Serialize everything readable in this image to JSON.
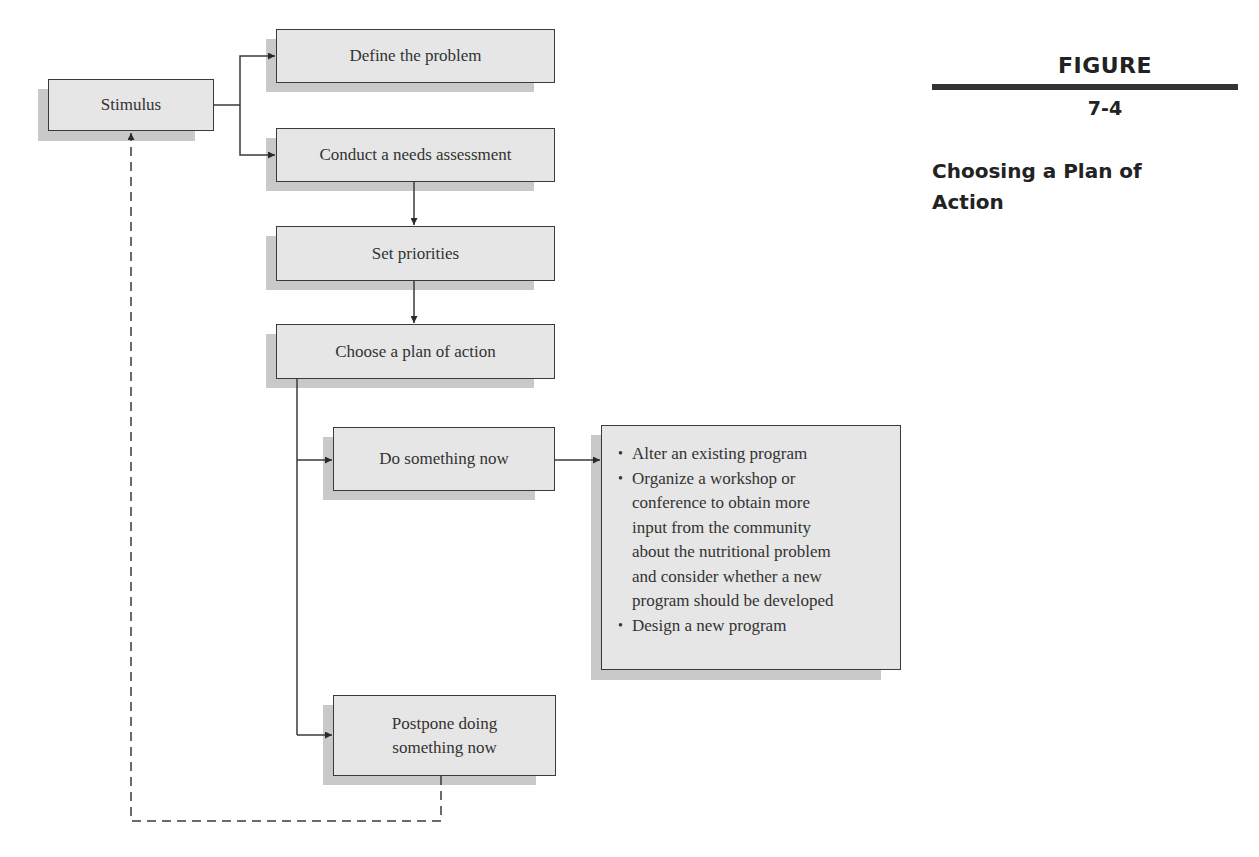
{
  "figure": {
    "label": "FIGURE",
    "number": "7-4",
    "title_line1": "Choosing a Plan of",
    "title_line2": "Action"
  },
  "nodes": {
    "stimulus": "Stimulus",
    "define_problem": "Define the problem",
    "needs_assessment": "Conduct a needs assessment",
    "set_priorities": "Set priorities",
    "choose_plan": "Choose a plan of action",
    "do_something": "Do something now",
    "postpone_line1": "Postpone doing",
    "postpone_line2": "something now"
  },
  "options": {
    "items": [
      "Alter an existing program",
      "Organize a workshop or conference to obtain more input from the community about the nutritional problem and consider whether a new program should be developed",
      "Design a new program"
    ],
    "item2_lines": [
      "Organize a workshop or",
      "conference to obtain more",
      "input from the community",
      "about the nutritional problem",
      "and consider whether a new",
      "program should be developed"
    ]
  },
  "edges": [
    {
      "from": "stimulus",
      "to": "define_problem",
      "style": "solid"
    },
    {
      "from": "stimulus",
      "to": "needs_assessment",
      "style": "solid"
    },
    {
      "from": "needs_assessment",
      "to": "set_priorities",
      "style": "solid"
    },
    {
      "from": "set_priorities",
      "to": "choose_plan",
      "style": "solid"
    },
    {
      "from": "choose_plan",
      "to": "do_something",
      "style": "solid"
    },
    {
      "from": "choose_plan",
      "to": "postpone",
      "style": "solid"
    },
    {
      "from": "do_something",
      "to": "options",
      "style": "solid"
    },
    {
      "from": "postpone",
      "to": "stimulus",
      "style": "dashed"
    }
  ],
  "colors": {
    "box_fill": "#e6e6e6",
    "box_shadow": "#c9c9c9",
    "stroke": "#3a3a3a"
  }
}
